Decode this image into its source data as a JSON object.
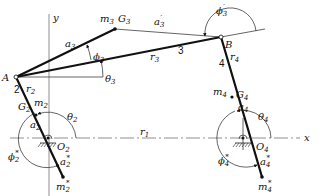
{
  "figure": {
    "axes": {
      "x_label": "x",
      "y_label": "y"
    },
    "points": {
      "A": "A",
      "B": "B",
      "O2": "O",
      "O2_sub": "2",
      "O4": "O",
      "O4_sub": "4"
    },
    "links": {
      "link2": "2",
      "link3": "3",
      "link4": "4"
    },
    "labels": {
      "r1": {
        "main": "r",
        "sub": "1"
      },
      "r2": {
        "main": "r",
        "sub": "2"
      },
      "r3": {
        "main": "r",
        "sub": "3"
      },
      "r4": {
        "main": "r",
        "sub": "4"
      },
      "m2": {
        "main": "m",
        "sub": "2"
      },
      "m3": {
        "main": "m",
        "sub": "3"
      },
      "m4": {
        "main": "m",
        "sub": "4"
      },
      "G2": {
        "main": "G",
        "sub": "2"
      },
      "G3": {
        "main": "G",
        "sub": "3"
      },
      "G4": {
        "main": "G",
        "sub": "4"
      },
      "a2": {
        "main": "a",
        "sub": "2"
      },
      "a3": {
        "main": "a",
        "sub": "3"
      },
      "a4": {
        "main": "a",
        "sub": "4"
      },
      "a3p": {
        "main": "a",
        "sub": "3",
        "sup": "′"
      },
      "a2s": {
        "main": "a",
        "sub": "2",
        "sup": "*"
      },
      "a4s": {
        "main": "a",
        "sub": "4",
        "sup": "*"
      },
      "m2s": {
        "main": "m",
        "sub": "2",
        "sup": "*"
      },
      "m4s": {
        "main": "m",
        "sub": "4",
        "sup": "*"
      },
      "theta2": {
        "main": "θ",
        "sub": "2"
      },
      "theta3": {
        "main": "θ",
        "sub": "3"
      },
      "theta4": {
        "main": "θ",
        "sub": "4"
      },
      "phi3": {
        "main": "ϕ",
        "sub": "3"
      },
      "phi3p": {
        "main": "ϕ",
        "sub": "3",
        "sup": "′"
      },
      "phi2s": {
        "main": "ϕ",
        "sub": "2",
        "sup": "*"
      },
      "phi4s": {
        "main": "ϕ",
        "sub": "4",
        "sup": "*"
      }
    }
  }
}
